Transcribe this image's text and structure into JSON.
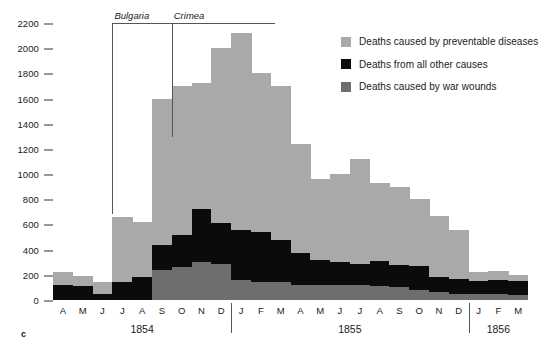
{
  "panel_letter": "c",
  "legend": {
    "position": "top-right",
    "items": [
      {
        "swatch": "prev",
        "color": "#a9a9a9",
        "label": "Deaths caused by preventable diseases"
      },
      {
        "swatch": "other",
        "color": "#0b0b0b",
        "label": "Deaths from all other causes"
      },
      {
        "swatch": "wounds",
        "color": "#6e6e6e",
        "label": "Deaths caused by war wounds"
      }
    ]
  },
  "annotations": [
    {
      "name": "bulgaria",
      "label": "Bulgaria",
      "start_index": 3,
      "end_index": 5
    },
    {
      "name": "crimea",
      "label": "Crimea",
      "start_index": 6,
      "end_index": 23
    }
  ],
  "year_groups": [
    {
      "label": "1854",
      "start_index": 0,
      "end_index": 8
    },
    {
      "label": "1855",
      "start_index": 9,
      "end_index": 20
    },
    {
      "label": "1856",
      "start_index": 21,
      "end_index": 23
    }
  ],
  "chart_data": {
    "type": "bar",
    "subtype": "stacked",
    "title": "",
    "xlabel": "",
    "ylabel": "",
    "ylim": [
      0,
      2200
    ],
    "yticks": [
      0,
      200,
      400,
      600,
      800,
      1000,
      1200,
      1400,
      1600,
      1800,
      2000,
      2200
    ],
    "grid": false,
    "legend_position": "top-right",
    "categories": [
      "A",
      "M",
      "J",
      "J",
      "A",
      "S",
      "O",
      "N",
      "D",
      "J",
      "F",
      "M",
      "A",
      "M",
      "J",
      "J",
      "A",
      "S",
      "O",
      "N",
      "D",
      "J",
      "F",
      "M"
    ],
    "category_years": [
      "1854",
      "1854",
      "1854",
      "1854",
      "1854",
      "1854",
      "1854",
      "1854",
      "1854",
      "1855",
      "1855",
      "1855",
      "1855",
      "1855",
      "1855",
      "1855",
      "1855",
      "1855",
      "1855",
      "1855",
      "1855",
      "1856",
      "1856",
      "1856"
    ],
    "series": [
      {
        "name": "Deaths caused by war wounds",
        "color": "#6e6e6e",
        "values": [
          0,
          0,
          0,
          0,
          0,
          240,
          260,
          300,
          290,
          160,
          140,
          140,
          120,
          120,
          120,
          120,
          110,
          100,
          80,
          60,
          50,
          50,
          50,
          40
        ]
      },
      {
        "name": "Deaths from all other causes",
        "color": "#0b0b0b",
        "values": [
          120,
          110,
          50,
          140,
          180,
          200,
          260,
          420,
          320,
          400,
          400,
          340,
          250,
          200,
          180,
          170,
          200,
          180,
          190,
          120,
          120,
          100,
          110,
          110
        ]
      },
      {
        "name": "Deaths caused by preventable diseases",
        "color": "#a9a9a9",
        "values": [
          100,
          80,
          90,
          520,
          440,
          1160,
          1180,
          1000,
          1390,
          1560,
          1260,
          1220,
          870,
          640,
          700,
          830,
          620,
          620,
          530,
          490,
          390,
          70,
          70,
          50
        ]
      }
    ],
    "totals": [
      220,
      190,
      140,
      660,
      620,
      1600,
      1700,
      1720,
      2000,
      2120,
      1800,
      1700,
      1240,
      960,
      1000,
      1120,
      930,
      900,
      800,
      670,
      560,
      220,
      230,
      200
    ]
  }
}
